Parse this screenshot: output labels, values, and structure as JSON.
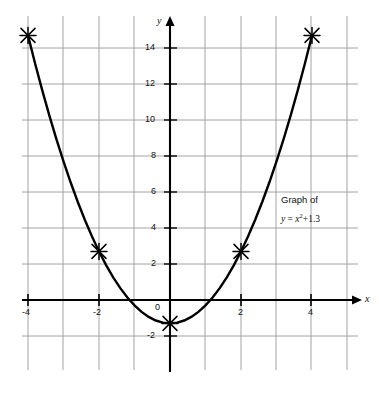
{
  "chart_data": {
    "type": "line",
    "title": "",
    "annotation_line1": "Graph of",
    "annotation_line2_prefix": "y",
    "annotation_line2_equals": " = ",
    "annotation_line2_var": "x",
    "annotation_line2_exp": "2",
    "annotation_line2_suffix": "+1.3",
    "annotation_full": "Graph of y = x²+1.3",
    "xlabel": "x",
    "ylabel": "y",
    "xlim": [
      -4.6,
      5.3
    ],
    "ylim": [
      -3.0,
      16.2
    ],
    "xticks": [
      -4,
      -2,
      0,
      2,
      4
    ],
    "xticklabels": [
      "-4",
      "-2",
      "0",
      "2",
      "4"
    ],
    "yticks": [
      -2,
      0,
      2,
      4,
      6,
      8,
      10,
      12,
      14
    ],
    "yticklabels": [
      "-2",
      "0",
      "2",
      "4",
      "6",
      "8",
      "10",
      "12",
      "14"
    ],
    "grid": true,
    "grid_color": "#9a9a9a",
    "curve_color": "#000000",
    "axis_color": "#000000",
    "equation_plotted": "y = x^2 - 1.3",
    "vertex": [
      0,
      -1.3
    ],
    "marked_points": [
      {
        "x": -4,
        "y": 14.7,
        "marker": "asterisk"
      },
      {
        "x": -2,
        "y": 2.7,
        "marker": "asterisk"
      },
      {
        "x": 0,
        "y": -1.3,
        "marker": "asterisk"
      },
      {
        "x": 2,
        "y": 2.7,
        "marker": "asterisk"
      },
      {
        "x": 4,
        "y": 14.7,
        "marker": "asterisk"
      }
    ],
    "x": [
      -4.0,
      -3.8,
      -3.6,
      -3.4,
      -3.2,
      -3.0,
      -2.8,
      -2.6,
      -2.4,
      -2.2,
      -2.0,
      -1.8,
      -1.6,
      -1.4,
      -1.2,
      -1.0,
      -0.8,
      -0.6,
      -0.4,
      -0.2,
      0.0,
      0.2,
      0.4,
      0.6,
      0.8,
      1.0,
      1.2,
      1.4,
      1.6,
      1.8,
      2.0,
      2.2,
      2.4,
      2.6,
      2.8,
      3.0,
      3.2,
      3.4,
      3.6,
      3.8,
      4.0
    ],
    "y": [
      14.7,
      13.14,
      11.66,
      10.26,
      8.94,
      7.7,
      6.54,
      5.46,
      4.46,
      3.54,
      2.7,
      1.94,
      1.26,
      0.66,
      0.14,
      -0.3,
      -0.66,
      -0.94,
      -1.14,
      -1.26,
      -1.3,
      -1.26,
      -1.14,
      -0.94,
      -0.66,
      -0.3,
      0.14,
      0.66,
      1.26,
      1.94,
      2.7,
      3.54,
      4.46,
      5.46,
      6.54,
      7.7,
      8.94,
      10.26,
      11.66,
      13.14,
      14.7
    ]
  }
}
